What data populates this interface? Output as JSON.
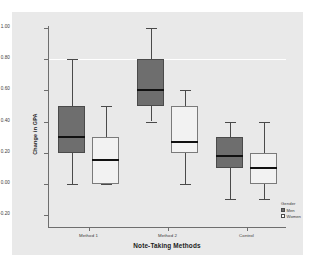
{
  "chart_data": {
    "type": "box",
    "title": "",
    "xlabel": "Note-Taking Methods",
    "ylabel": "Change in GPA",
    "categories": [
      "Method 1",
      "Method 2",
      "Control"
    ],
    "ylim": [
      -0.2,
      1.0
    ],
    "yticks": [
      1.0,
      0.8,
      0.6,
      0.4,
      0.2,
      0.0,
      -0.2
    ],
    "ytick_labels": [
      "1.00",
      "0.80",
      "0.60",
      "0.40",
      "0.20",
      "0.00",
      "-0.20"
    ],
    "grid": "single white reference line at 0.80",
    "legend": {
      "title": "Gender",
      "position": "right-bottom",
      "entries": [
        {
          "label": "Men",
          "color": "#6e6e6e"
        },
        {
          "label": "Women",
          "color": "#ffffff"
        }
      ]
    },
    "series": [
      {
        "name": "Men",
        "color": "#6e6e6e",
        "boxes": [
          {
            "category": "Method 1",
            "whisker_low": 0.0,
            "q1": 0.2,
            "median": 0.3,
            "q3": 0.5,
            "whisker_high": 0.8
          },
          {
            "category": "Method 2",
            "whisker_low": 0.4,
            "q1": 0.5,
            "median": 0.6,
            "q3": 0.8,
            "whisker_high": 1.0
          },
          {
            "category": "Control",
            "whisker_low": -0.1,
            "q1": 0.1,
            "median": 0.18,
            "q3": 0.3,
            "whisker_high": 0.4
          }
        ]
      },
      {
        "name": "Women",
        "color": "#ffffff",
        "boxes": [
          {
            "category": "Method 1",
            "whisker_low": 0.0,
            "q1": 0.0,
            "median": 0.15,
            "q3": 0.3,
            "whisker_high": 0.5
          },
          {
            "category": "Method 2",
            "whisker_low": 0.0,
            "q1": 0.2,
            "median": 0.27,
            "q3": 0.5,
            "whisker_high": 0.6
          },
          {
            "category": "Control",
            "whisker_low": -0.1,
            "q1": 0.0,
            "median": 0.1,
            "q3": 0.2,
            "whisker_high": 0.4
          }
        ]
      }
    ]
  },
  "axes": {
    "y_title": "Change in GPA",
    "x_title": "Note-Taking Methods"
  },
  "legend": {
    "title": "Gender",
    "men_label": "Men",
    "women_label": "Women"
  }
}
